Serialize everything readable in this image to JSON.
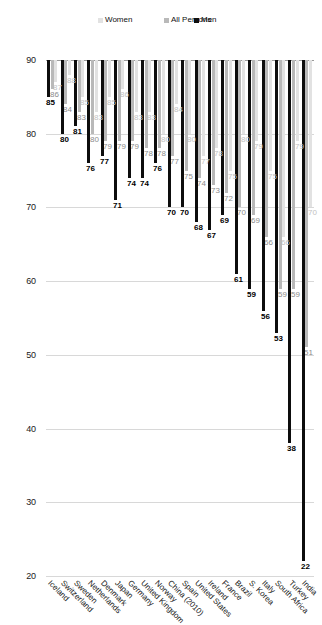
{
  "chart_data": {
    "type": "bar",
    "title": "",
    "subtitle": "",
    "xlabel": "",
    "ylabel": "",
    "orientation": "horizontal",
    "grid": true,
    "legend_position": "left",
    "axis": {
      "min": 20,
      "max": 90,
      "reversed": true,
      "ticks": [
        90,
        80,
        70,
        60,
        50,
        40,
        30,
        20
      ],
      "tick_labels": [
        "90",
        "80",
        "70",
        "60",
        "50",
        "40",
        "30",
        "20"
      ]
    },
    "categories": [
      "India",
      "Turkey",
      "South Africa",
      "Italy",
      "S. Korea",
      "Brazil",
      "France",
      "Ireland",
      "United States",
      "Spain",
      "China (2010)",
      "Norway",
      "United Kingdom",
      "Germany",
      "Japan",
      "Denmark",
      "Netherlands",
      "Sweden",
      "Switzerland",
      "Iceland"
    ],
    "series": [
      {
        "name": "Men",
        "color": "#0d0d0d",
        "values": [
          22,
          38,
          53,
          56,
          59,
          61,
          69,
          67,
          68,
          70,
          70,
          76,
          74,
          74,
          71,
          77,
          76,
          81,
          80,
          85
        ]
      },
      {
        "name": "All Persons",
        "color": "#b9b9b9",
        "values": [
          51,
          59,
          59,
          66,
          69,
          70,
          72,
          73,
          74,
          75,
          77,
          78,
          78,
          79,
          79,
          79,
          80,
          83,
          84,
          86
        ]
      },
      {
        "name": "Women",
        "color": "#e2e2e2",
        "values": [
          70,
          79,
          66,
          75,
          79,
          80,
          75,
          78,
          77,
          80,
          84,
          80,
          83,
          83,
          86,
          85,
          83,
          85,
          88,
          87
        ]
      }
    ]
  },
  "legend": {
    "items": [
      {
        "label": "Men",
        "color": "#0d0d0d"
      },
      {
        "label": "All Persons",
        "color": "#b9b9b9"
      },
      {
        "label": "Women",
        "color": "#e2e2e2"
      }
    ]
  }
}
